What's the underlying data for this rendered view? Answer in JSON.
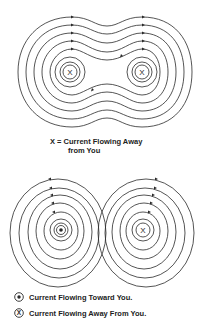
{
  "top_figure": {
    "name": "parallel-conductors-same-direction",
    "conductors": [
      {
        "symbol": "X",
        "meaning": "away"
      },
      {
        "symbol": "X",
        "meaning": "away"
      }
    ],
    "caption_line1": "X = Current Flowing Away",
    "caption_line2": "from You"
  },
  "bottom_figure": {
    "name": "parallel-conductors-opposite-direction",
    "conductors": [
      {
        "symbol": "•",
        "meaning": "toward"
      },
      {
        "symbol": "X",
        "meaning": "away"
      }
    ]
  },
  "legend": {
    "items": [
      {
        "symbol": "dot",
        "label": "Current Flowing Toward You."
      },
      {
        "symbol": "X",
        "label": "Current Flowing Away From You."
      }
    ]
  },
  "colors": {
    "line": "#2a2a2a",
    "background": "#ffffff"
  }
}
